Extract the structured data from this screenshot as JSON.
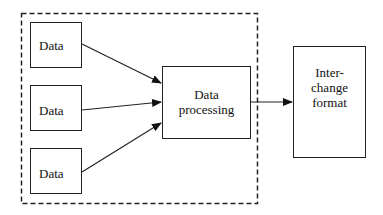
{
  "diagram": {
    "type": "flow",
    "sources": [
      {
        "label": "Data"
      },
      {
        "label": "Data"
      },
      {
        "label": "Data"
      }
    ],
    "processor": {
      "label_line1": "Data",
      "label_line2": "processing"
    },
    "output": {
      "label_line1": "Inter-",
      "label_line2": "change",
      "label_line3": "format"
    },
    "boundary": {
      "style": "dashed",
      "encloses": [
        "sources",
        "processor"
      ]
    },
    "edges": [
      {
        "from": "Data 1",
        "to": "Data processing"
      },
      {
        "from": "Data 2",
        "to": "Data processing"
      },
      {
        "from": "Data 3",
        "to": "Data processing"
      },
      {
        "from": "Data processing",
        "to": "Interchange format"
      }
    ],
    "colors": {
      "stroke": "#222222",
      "background": "#ffffff"
    }
  }
}
